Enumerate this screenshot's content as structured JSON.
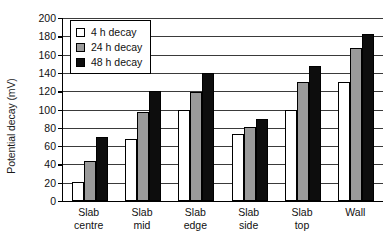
{
  "chart_data": {
    "type": "bar",
    "title": "",
    "xlabel": "",
    "ylabel": "Potential decay (mV)",
    "ylim": [
      0,
      200
    ],
    "ytick_step": 20,
    "yticks": [
      200,
      180,
      160,
      140,
      120,
      100,
      80,
      60,
      40,
      20,
      0
    ],
    "grid": true,
    "legend_position": "top-left-inside",
    "categories": [
      "Slab centre",
      "Slab mid",
      "Slab edge",
      "Slab side",
      "Slab top",
      "Wall"
    ],
    "category_lines": [
      [
        "Slab",
        "centre"
      ],
      [
        "Slab",
        "mid"
      ],
      [
        "Slab",
        "edge"
      ],
      [
        "Slab",
        "side"
      ],
      [
        "Slab",
        "top"
      ],
      [
        "Wall",
        ""
      ]
    ],
    "series": [
      {
        "name": "4 h decay",
        "color": "#ffffff",
        "values": [
          21,
          68,
          100,
          73,
          100,
          130
        ]
      },
      {
        "name": "24 h decay",
        "color": "#9a9a9a",
        "values": [
          44,
          97,
          119,
          81,
          130,
          167
        ]
      },
      {
        "name": "48 h decay",
        "color": "#0d0d0d",
        "values": [
          70,
          120,
          140,
          90,
          148,
          182
        ]
      }
    ]
  }
}
